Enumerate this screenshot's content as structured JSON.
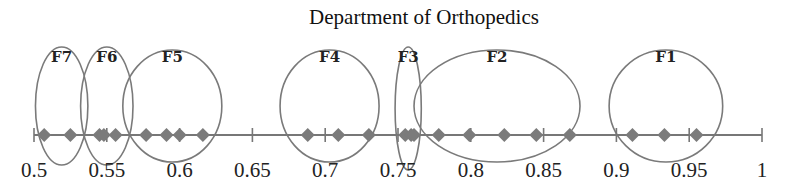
{
  "chart_data": {
    "type": "scatter",
    "title": "Department of Orthopedics",
    "xlabel": "",
    "ylabel": "",
    "xlim": [
      0.5,
      1.0
    ],
    "x_ticks": [
      0.5,
      0.55,
      0.6,
      0.65,
      0.7,
      0.75,
      0.8,
      0.85,
      0.9,
      0.95,
      1
    ],
    "x_tick_labels": [
      "0.5",
      "0.55",
      "0.6",
      "0.65",
      "0.7",
      "0.75",
      "0.8",
      "0.85",
      "0.9",
      "0.95",
      "1"
    ],
    "grid": false,
    "legend": null,
    "marker": "diamond",
    "marker_color": "#7b7b7b",
    "ellipse_color": "#7a7a7a",
    "clusters": [
      {
        "label": "F7",
        "values": [
          0.507,
          0.525
        ],
        "ellipse": {
          "cx": 0.519,
          "rx": 0.018,
          "top": 47,
          "bottom": 165
        }
      },
      {
        "label": "F6",
        "values": [
          0.545,
          0.548,
          0.556
        ],
        "ellipse": {
          "cx": 0.55,
          "rx": 0.018,
          "top": 47,
          "bottom": 165
        }
      },
      {
        "label": "F5",
        "values": [
          0.577,
          0.591,
          0.6,
          0.616
        ],
        "ellipse": {
          "cx": 0.595,
          "rx": 0.034,
          "top": 50,
          "bottom": 162
        }
      },
      {
        "label": "F4",
        "values": [
          0.688,
          0.709,
          0.73
        ],
        "ellipse": {
          "cx": 0.703,
          "rx": 0.034,
          "top": 50,
          "bottom": 162
        }
      },
      {
        "label": "F3",
        "values": [
          0.755,
          0.759,
          0.761
        ],
        "ellipse": {
          "cx": 0.757,
          "rx": 0.009,
          "top": 47,
          "bottom": 170
        }
      },
      {
        "label": "F2",
        "values": [
          0.778,
          0.799,
          0.823,
          0.845,
          0.868
        ],
        "ellipse": {
          "cx": 0.818,
          "rx": 0.057,
          "top": 50,
          "bottom": 162
        }
      },
      {
        "label": "F1",
        "values": [
          0.911,
          0.933,
          0.955
        ],
        "ellipse": {
          "cx": 0.934,
          "rx": 0.039,
          "top": 50,
          "bottom": 162
        }
      }
    ]
  }
}
